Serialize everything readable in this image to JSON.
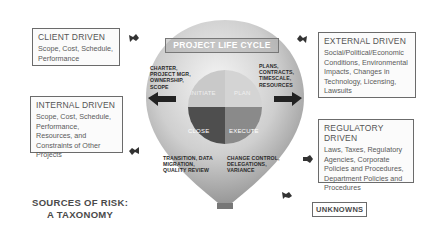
{
  "diagram": {
    "center": {
      "title": "PROJECT LIFE CYCLE",
      "quadrants": [
        {
          "label": "INITIATE",
          "color": "#c9c9c9",
          "notes": "CHARTER, PROJECT MGR, OWNERSHIP, SCOPE"
        },
        {
          "label": "PLAN",
          "color": "#d4d4d4",
          "notes": "PLANS, CONTRACTS, TIMESCALE, RESOURCES"
        },
        {
          "label": "EXECUTE",
          "color": "#8a8a8a",
          "notes": "CHANGE CONTROL, DELEGATIONS, VARIANCE"
        },
        {
          "label": "CLOSE",
          "color": "#4e4e4e",
          "notes": "TRANSITION, DATA MIGRATION, QUALITY REVIEW"
        }
      ]
    },
    "sources": [
      {
        "title": "CLIENT DRIVEN",
        "body": "Scope, Cost, Schedule, Performance"
      },
      {
        "title": "INTERNAL DRIVEN",
        "body": "Scope, Cost, Schedule, Performance, Resources, and Constraints of Other Projects"
      },
      {
        "title": "EXTERNAL DRIVEN",
        "body": "Social/Political/Economic Conditions, Environmental Impacts, Changes in Technology, Licensing, Lawsuits"
      },
      {
        "title": "REGULATORY DRIVEN",
        "body": "Laws, Taxes, Regulatory Agencies, Corporate Policies and Procedures, Department Policies and Procedures"
      },
      {
        "title": "UNKNOWNS",
        "body": ""
      }
    ],
    "caption": {
      "line1": "SOURCES OF RISK:",
      "line2": "A TAXONOMY"
    }
  }
}
